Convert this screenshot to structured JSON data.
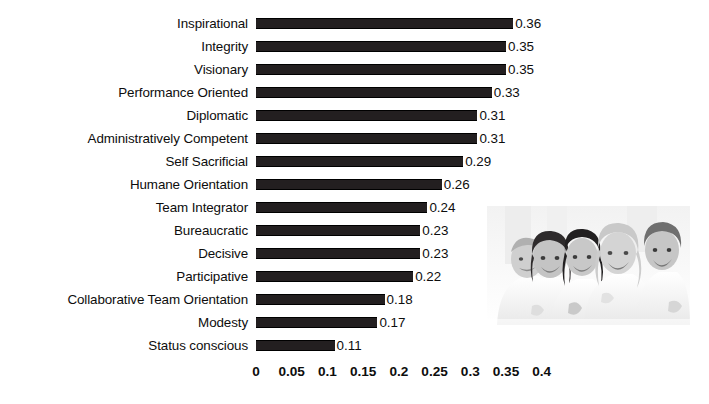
{
  "chart_data": {
    "type": "bar",
    "orientation": "horizontal",
    "title": "",
    "subtitle": "",
    "xlabel": "",
    "ylabel": "",
    "xlim": [
      0,
      0.4
    ],
    "grid": false,
    "legend": null,
    "bar_color": "#231f20",
    "background_color": "#ffffff",
    "categories": [
      "Inspirational",
      "Integrity",
      "Visionary",
      "Performance Oriented",
      "Diplomatic",
      "Administratively Competent",
      "Self Sacrificial",
      "Humane Orientation",
      "Team Integrator",
      "Bureaucratic",
      "Decisive",
      "Participative",
      "Collaborative Team Orientation",
      "Modesty",
      "Status conscious"
    ],
    "values": [
      0.36,
      0.35,
      0.35,
      0.33,
      0.31,
      0.31,
      0.29,
      0.26,
      0.24,
      0.23,
      0.23,
      0.22,
      0.18,
      0.17,
      0.11
    ],
    "value_labels": [
      "0.36",
      "0.35",
      "0.35",
      "0.33",
      "0.31",
      "0.31",
      "0.29",
      "0.26",
      "0.24",
      "0.23",
      "0.23",
      "0.22",
      "0.18",
      "0.17",
      "0.11"
    ],
    "xticks": [
      0,
      0.05,
      0.1,
      0.15,
      0.2,
      0.25,
      0.3,
      0.35,
      0.4
    ],
    "xtick_labels": [
      "0",
      "0.05",
      "0.1",
      "0.15",
      "0.2",
      "0.25",
      "0.3",
      "0.35",
      "0.4"
    ]
  },
  "photo": {
    "caption": "group-of-five-smiling-people-photo",
    "description": "Grayscale photograph of five smiling people in white shirts"
  }
}
